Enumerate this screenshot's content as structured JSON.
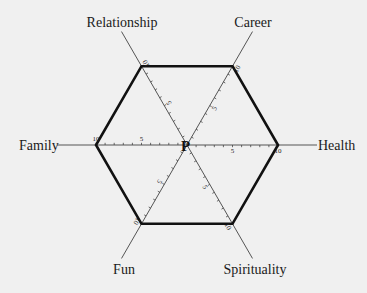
{
  "chart_data": {
    "type": "radar",
    "title": "",
    "center_label": "P",
    "scale": {
      "min": 0,
      "max": 10,
      "major_ticks": [
        5,
        10
      ],
      "minor_step": 1
    },
    "axes": [
      {
        "name": "Career",
        "angle_deg": 60,
        "value": 10
      },
      {
        "name": "Health",
        "angle_deg": 0,
        "value": 10
      },
      {
        "name": "Spirituality",
        "angle_deg": -60,
        "value": 10
      },
      {
        "name": "Fun",
        "angle_deg": -120,
        "value": 10
      },
      {
        "name": "Family",
        "angle_deg": 180,
        "value": 10
      },
      {
        "name": "Relationship",
        "angle_deg": 120,
        "value": 10
      }
    ],
    "series": [
      {
        "name": "Life balance",
        "values": [
          10,
          10,
          10,
          10,
          10,
          10
        ]
      }
    ]
  },
  "labels": {
    "relationship": "Relationship",
    "career": "Career",
    "family": "Family",
    "health": "Health",
    "fun": "Fun",
    "spirituality": "Spirituality",
    "center": "P",
    "tick_five": "5",
    "tick_ten": "10"
  }
}
